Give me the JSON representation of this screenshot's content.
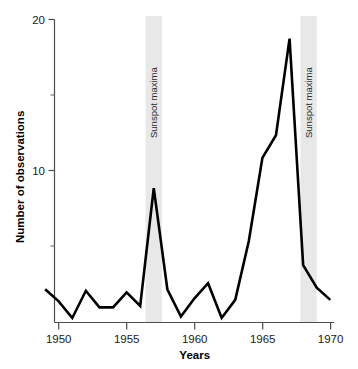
{
  "chart_data": {
    "type": "line",
    "title": "",
    "xlabel": "Years",
    "ylabel": "Number of observations",
    "xlim": [
      1948.8,
      1970.2
    ],
    "ylim": [
      0,
      20
    ],
    "grid": false,
    "legend": "none",
    "x_ticks": [
      1950,
      1955,
      1960,
      1965,
      1970
    ],
    "x_tick_labels": [
      "1950",
      "1955",
      "1960",
      "1965",
      "1970"
    ],
    "y_ticks": [
      10,
      20
    ],
    "y_tick_labels": [
      "10",
      "20"
    ],
    "y_minor_ticks": [
      5,
      15
    ],
    "series": [
      {
        "name": "Number of observations",
        "x": [
          1949,
          1950,
          1951,
          1952,
          1953,
          1954,
          1955,
          1956,
          1957,
          1958,
          1959,
          1960,
          1961,
          1962,
          1963,
          1964,
          1965,
          1966,
          1967,
          1968,
          1969,
          1970
        ],
        "values": [
          2.2,
          1.4,
          0.3,
          2.1,
          1.0,
          1.0,
          2.0,
          1.1,
          8.9,
          2.2,
          0.4,
          1.6,
          2.6,
          0.3,
          1.5,
          5.4,
          10.9,
          12.4,
          18.8,
          3.8,
          2.3,
          1.5
        ]
      }
    ],
    "annotations": [
      {
        "label": "Sunspot maxima",
        "x_start": 1956.4,
        "x_end": 1957.6
      },
      {
        "label": "Sunspot maxima",
        "x_start": 1967.8,
        "x_end": 1969.0
      }
    ]
  },
  "axes": {
    "y_title": "Number of observations",
    "x_title": "Years",
    "y_labels": {
      "twenty": "20",
      "ten": "10"
    },
    "x_labels": {
      "t1950": "1950",
      "t1955": "1955",
      "t1960": "1960",
      "t1965": "1965",
      "t1970": "1970"
    }
  },
  "bands": {
    "first_label": "Sunspot maxima",
    "second_label": "Sunspot maxima"
  },
  "colors": {
    "line": "#000000",
    "band": "#e8e8e8",
    "axis": "#4d4d4d",
    "text": "#1a1a1a"
  }
}
